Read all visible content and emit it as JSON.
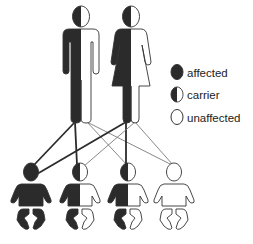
{
  "colors": {
    "affected": "#2b2b2b",
    "unaffected": "#ffffff",
    "outline": "#333333",
    "dark_line": "#2b2b2b",
    "light_line": "#7a7a7a"
  },
  "legend": {
    "items": [
      {
        "key": "affected",
        "label": "affected"
      },
      {
        "key": "carrier",
        "label": "carrier"
      },
      {
        "key": "unaffected",
        "label": "unaffected"
      }
    ]
  },
  "parents": [
    {
      "role": "father",
      "status": "carrier"
    },
    {
      "role": "mother",
      "status": "carrier"
    }
  ],
  "children": [
    {
      "status": "affected"
    },
    {
      "status": "carrier"
    },
    {
      "status": "carrier"
    },
    {
      "status": "unaffected"
    }
  ],
  "inheritance_links": [
    {
      "from": "father",
      "allele": "affected",
      "to_child": 0
    },
    {
      "from": "father",
      "allele": "affected",
      "to_child": 1
    },
    {
      "from": "father",
      "allele": "unaffected",
      "to_child": 2
    },
    {
      "from": "father",
      "allele": "unaffected",
      "to_child": 3
    },
    {
      "from": "mother",
      "allele": "affected",
      "to_child": 0
    },
    {
      "from": "mother",
      "allele": "affected",
      "to_child": 2
    },
    {
      "from": "mother",
      "allele": "unaffected",
      "to_child": 1
    },
    {
      "from": "mother",
      "allele": "unaffected",
      "to_child": 3
    }
  ]
}
